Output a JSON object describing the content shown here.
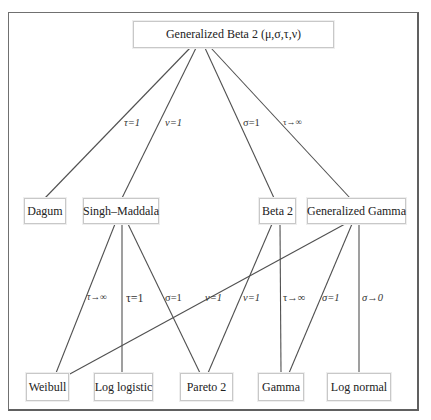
{
  "diagram": {
    "root": {
      "label": "Generalized Beta 2 (μ,σ,τ,ν)"
    },
    "level2": [
      {
        "id": "dagum",
        "label": "Dagum"
      },
      {
        "id": "singh_maddala",
        "label": "Singh–Maddala"
      },
      {
        "id": "beta2",
        "label": "Beta 2"
      },
      {
        "id": "gen_gamma",
        "label": "Generalized Gamma"
      }
    ],
    "level3": [
      {
        "id": "weibull",
        "label": "Weibull"
      },
      {
        "id": "log_logistic",
        "label": "Log logistic"
      },
      {
        "id": "pareto2",
        "label": "Pareto 2"
      },
      {
        "id": "gamma",
        "label": "Gamma"
      },
      {
        "id": "log_normal",
        "label": "Log normal"
      }
    ],
    "edges": [
      {
        "from": "root",
        "to": "dagum",
        "label": "τ=1"
      },
      {
        "from": "root",
        "to": "singh_maddala",
        "label": "ν=1"
      },
      {
        "from": "root",
        "to": "beta2",
        "label": "σ=1"
      },
      {
        "from": "root",
        "to": "gen_gamma",
        "label": "τ→∞"
      },
      {
        "from": "singh_maddala",
        "to": "weibull",
        "label": "τ→∞"
      },
      {
        "from": "singh_maddala",
        "to": "log_logistic",
        "label": "τ=1"
      },
      {
        "from": "singh_maddala",
        "to": "pareto2",
        "label": "σ=1"
      },
      {
        "from": "gen_gamma",
        "to": "weibull",
        "label": "ν=1"
      },
      {
        "from": "beta2",
        "to": "pareto2",
        "label": "ν=1"
      },
      {
        "from": "beta2",
        "to": "gamma",
        "label": "τ→∞"
      },
      {
        "from": "gen_gamma",
        "to": "gamma",
        "label": "σ=1"
      },
      {
        "from": "gen_gamma",
        "to": "log_normal",
        "label": "σ→0"
      }
    ]
  }
}
